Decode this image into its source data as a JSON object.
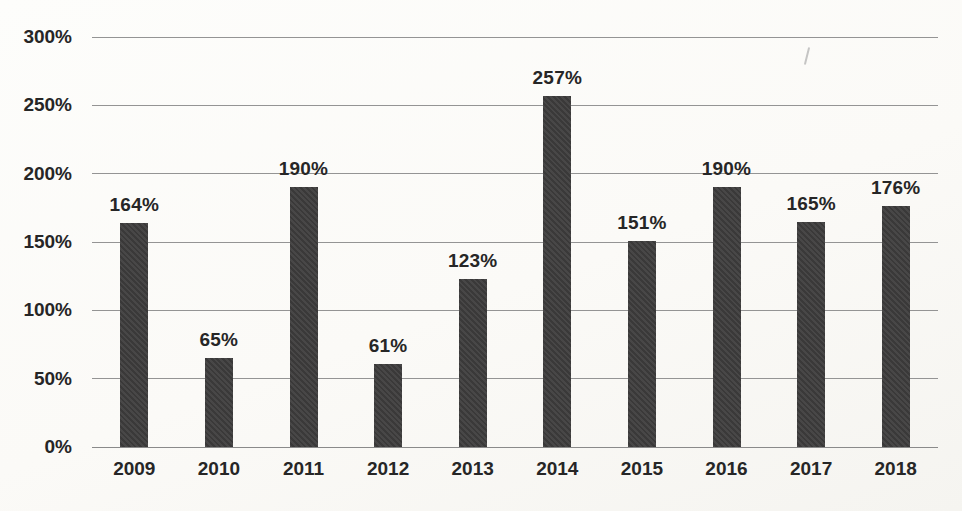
{
  "chart_data": {
    "type": "bar",
    "title": "",
    "categories": [
      "2009",
      "2010",
      "2011",
      "2012",
      "2013",
      "2014",
      "2015",
      "2016",
      "2017",
      "2018"
    ],
    "values": [
      164,
      65,
      190,
      61,
      123,
      257,
      151,
      190,
      165,
      176
    ],
    "data_labels": [
      "164%",
      "65%",
      "190%",
      "61%",
      "123%",
      "257%",
      "151%",
      "190%",
      "165%",
      "176%"
    ],
    "xlabel": "",
    "ylabel": "",
    "ylim": [
      0,
      300
    ],
    "ytick_values": [
      0,
      50,
      100,
      150,
      200,
      250,
      300
    ],
    "ytick_labels": [
      "0%",
      "50%",
      "100%",
      "150%",
      "200%",
      "250%",
      "300%"
    ],
    "grid": "horizontal",
    "legend": "none",
    "colors": {
      "bar": "#3e3d3d",
      "gridline": "#949494",
      "baseline": "#8a8a8a",
      "text": "#262626",
      "background": "#fbfaf7"
    }
  }
}
